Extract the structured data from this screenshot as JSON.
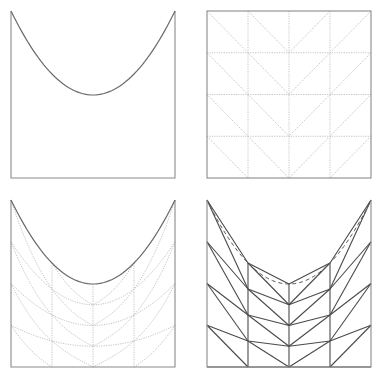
{
  "figure": {
    "width": 380,
    "height": 381,
    "background": "#ffffff",
    "grid": {
      "cols": 4,
      "rows": 4
    },
    "colors": {
      "frame": "#8a8a8a",
      "curve": "#6a6a6a",
      "dotted": "#c4c4c4",
      "mesh": "#4a4a4a",
      "dashed": "#5a5a5a"
    },
    "panels": [
      {
        "id": "parabola-domain",
        "description": "Square domain with parabolic top boundary",
        "box": {
          "left": 11,
          "top": 11,
          "right": 175,
          "bottom": 178
        },
        "vertex_y": 95,
        "show": {
          "frame": true,
          "parabola": true,
          "grid": false,
          "mapped_grid": false,
          "mesh": false
        }
      },
      {
        "id": "reference-grid",
        "description": "Reference square with 4x4 dotted grid and V-oriented diagonals",
        "box": {
          "left": 207,
          "top": 11,
          "right": 371,
          "bottom": 178
        },
        "vertex_y": 95,
        "show": {
          "frame": true,
          "parabola": false,
          "grid": true,
          "mapped_grid": false,
          "mesh": false
        }
      },
      {
        "id": "mapped-grid",
        "description": "Grid mapped onto parabolic domain (dotted curves)",
        "box": {
          "left": 11,
          "top": 200,
          "right": 175,
          "bottom": 367
        },
        "vertex_y": 284,
        "show": {
          "frame": true,
          "parabola": true,
          "grid": false,
          "mapped_grid": true,
          "mesh": false
        }
      },
      {
        "id": "triangulated-mesh",
        "description": "Piecewise-linear triangulated mesh with dashed exact parabola",
        "box": {
          "left": 207,
          "top": 200,
          "right": 371,
          "bottom": 367
        },
        "vertex_y": 284,
        "show": {
          "frame": true,
          "parabola": false,
          "grid": false,
          "mapped_grid": false,
          "mesh": true,
          "dashed_parabola": true
        }
      }
    ]
  }
}
